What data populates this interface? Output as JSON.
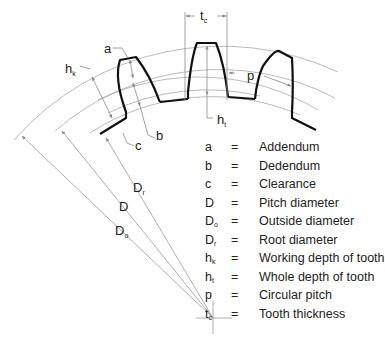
{
  "diagram": {
    "center": {
      "x": 213,
      "y": 318
    },
    "colors": {
      "tooth": "#111111",
      "construction": "#9a9a9a",
      "text": "#222222"
    },
    "labels": {
      "a": "a",
      "b": "b",
      "c": "c",
      "hk": {
        "base": "h",
        "sub": "k"
      },
      "ht": {
        "base": "h",
        "sub": "t"
      },
      "tc": {
        "base": "t",
        "sub": "c"
      },
      "p": "p",
      "Dr": {
        "base": "D",
        "sub": "r"
      },
      "D": {
        "base": "D",
        "sub": ""
      },
      "Do": {
        "base": "D",
        "sub": "o"
      }
    }
  },
  "legend": [
    {
      "sym": "a",
      "sub": "",
      "eq": "=",
      "desc": "Addendum"
    },
    {
      "sym": "b",
      "sub": "",
      "eq": "=",
      "desc": "Dedendum"
    },
    {
      "sym": "c",
      "sub": "",
      "eq": "=",
      "desc": "Clearance"
    },
    {
      "sym": "D",
      "sub": "",
      "eq": "=",
      "desc": "Pitch diameter"
    },
    {
      "sym": "D",
      "sub": "o",
      "eq": "=",
      "desc": "Outside diameter"
    },
    {
      "sym": "D",
      "sub": "r",
      "eq": "=",
      "desc": "Root diameter"
    },
    {
      "sym": "h",
      "sub": "k",
      "eq": "=",
      "desc": "Working depth of tooth"
    },
    {
      "sym": "h",
      "sub": "t",
      "eq": "=",
      "desc": "Whole depth of tooth"
    },
    {
      "sym": "p",
      "sub": "",
      "eq": "=",
      "desc": "Circular pitch"
    },
    {
      "sym": "t",
      "sub": "c",
      "eq": "=",
      "desc": "Tooth thickness"
    }
  ]
}
